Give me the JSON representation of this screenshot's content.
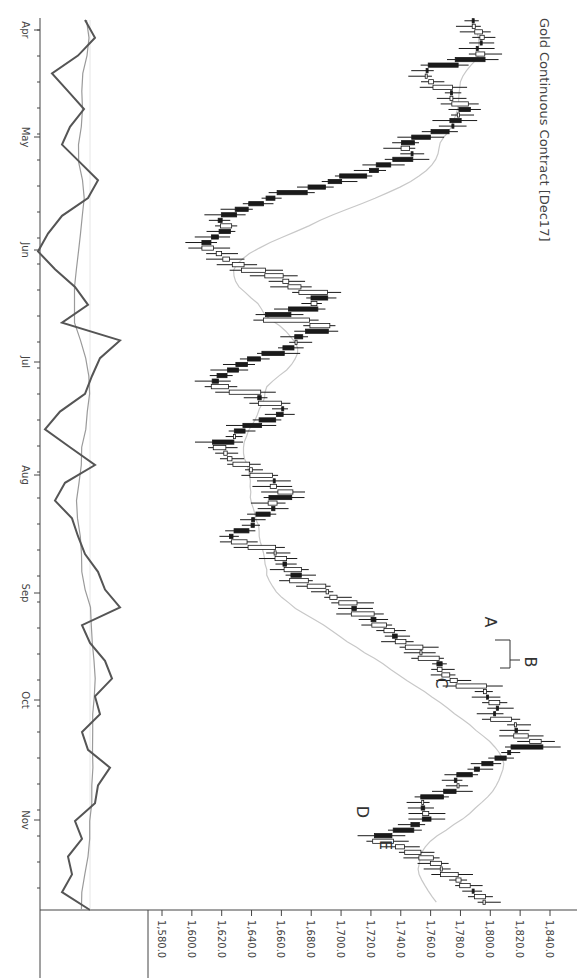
{
  "chart_data": {
    "type": "candlestick",
    "title": "Gold Continuous Contract [Dec17]",
    "orientation": "rotated-90-clockwise",
    "xlabel": "",
    "ylabel": "",
    "price_axis": {
      "ticks": [
        "1,580.0",
        "1,600.0",
        "1,620.0",
        "1,640.0",
        "1,660.0",
        "1,680.0",
        "1,700.0",
        "1,720.0",
        "1,740.0",
        "1,760.0",
        "1,780.0",
        "1,800.0",
        "1,820.0",
        "1,840.0"
      ],
      "values": [
        1580,
        1600,
        1620,
        1640,
        1660,
        1680,
        1700,
        1720,
        1740,
        1760,
        1780,
        1800,
        1820,
        1840
      ],
      "range": [
        1570,
        1850
      ]
    },
    "date_axis": {
      "ticks": [
        "Apr",
        "May",
        "Jun",
        "Jul",
        "Aug",
        "Sep",
        "Oct",
        "Nov"
      ]
    },
    "annotations": [
      {
        "label": "A",
        "approx_price": 1794,
        "approx_date": "mid-Sep"
      },
      {
        "label": "B",
        "approx_price": 1830,
        "approx_date": "late-Sep"
      },
      {
        "label": "C",
        "approx_price": 1763,
        "approx_date": "late-Sep"
      },
      {
        "label": "D",
        "approx_price": 1716,
        "approx_date": "early-Nov"
      },
      {
        "label": "E",
        "approx_price": 1741,
        "approx_date": "mid-Nov"
      }
    ],
    "series": [
      {
        "name": "Price (OHLC candles)",
        "type": "candlestick",
        "close_trajectory": [
          [
            0,
            1788
          ],
          [
            6,
            1795
          ],
          [
            10,
            1790
          ],
          [
            14,
            1802
          ],
          [
            16,
            1780
          ],
          [
            20,
            1755
          ],
          [
            24,
            1760
          ],
          [
            28,
            1773
          ],
          [
            32,
            1782
          ],
          [
            36,
            1778
          ],
          [
            40,
            1783
          ],
          [
            44,
            1770
          ],
          [
            48,
            1755
          ],
          [
            52,
            1742
          ],
          [
            56,
            1748
          ],
          [
            60,
            1735
          ],
          [
            64,
            1712
          ],
          [
            68,
            1690
          ],
          [
            72,
            1668
          ],
          [
            74,
            1650
          ],
          [
            76,
            1640
          ],
          [
            80,
            1628
          ],
          [
            84,
            1612
          ],
          [
            86,
            1635
          ],
          [
            90,
            1618
          ],
          [
            94,
            1605
          ],
          [
            98,
            1620
          ],
          [
            102,
            1628
          ],
          [
            106,
            1655
          ],
          [
            110,
            1665
          ],
          [
            114,
            1690
          ],
          [
            118,
            1682
          ],
          [
            122,
            1668
          ],
          [
            124,
            1652
          ],
          [
            128,
            1690
          ],
          [
            132,
            1672
          ],
          [
            136,
            1670
          ],
          [
            140,
            1655
          ],
          [
            142,
            1640
          ],
          [
            146,
            1622
          ],
          [
            150,
            1612
          ],
          [
            154,
            1625
          ],
          [
            156,
            1638
          ],
          [
            160,
            1650
          ],
          [
            164,
            1660
          ],
          [
            168,
            1645
          ],
          [
            172,
            1632
          ],
          [
            176,
            1622
          ],
          [
            180,
            1618
          ],
          [
            184,
            1628
          ],
          [
            188,
            1640
          ],
          [
            190,
            1650
          ],
          [
            194,
            1655
          ],
          [
            198,
            1665
          ],
          [
            200,
            1660
          ],
          [
            206,
            1652
          ],
          [
            210,
            1648
          ],
          [
            214,
            1636
          ],
          [
            218,
            1630
          ],
          [
            222,
            1650
          ],
          [
            226,
            1660
          ],
          [
            230,
            1668
          ],
          [
            234,
            1672
          ],
          [
            238,
            1685
          ],
          [
            240,
            1690
          ],
          [
            244,
            1700
          ],
          [
            248,
            1710
          ],
          [
            252,
            1722
          ],
          [
            254,
            1730
          ],
          [
            256,
            1735
          ],
          [
            260,
            1742
          ],
          [
            264,
            1752
          ],
          [
            268,
            1762
          ],
          [
            272,
            1768
          ],
          [
            276,
            1776
          ],
          [
            280,
            1790
          ],
          [
            284,
            1796
          ],
          [
            288,
            1800
          ],
          [
            292,
            1803
          ],
          [
            296,
            1810
          ],
          [
            300,
            1820
          ],
          [
            304,
            1830
          ],
          [
            306,
            1822
          ],
          [
            310,
            1808
          ],
          [
            314,
            1798
          ],
          [
            318,
            1784
          ],
          [
            322,
            1775
          ],
          [
            324,
            1772
          ],
          [
            328,
            1755
          ],
          [
            332,
            1750
          ],
          [
            336,
            1762
          ],
          [
            340,
            1735
          ],
          [
            344,
            1718
          ],
          [
            346,
            1740
          ],
          [
            350,
            1752
          ],
          [
            354,
            1760
          ],
          [
            358,
            1772
          ],
          [
            362,
            1782
          ],
          [
            366,
            1790
          ],
          [
            370,
            1795
          ],
          [
            372,
            1790
          ]
        ]
      },
      {
        "name": "Moving average (price)",
        "type": "line"
      },
      {
        "name": "Oscillator (fast)",
        "type": "line",
        "panel": "indicator"
      },
      {
        "name": "Oscillator (slow)",
        "type": "line",
        "panel": "indicator"
      }
    ],
    "grid": false,
    "legend": "none"
  },
  "labels": {
    "title": "Gold Continuous Contract [Dec17]",
    "annotation_a": "A",
    "annotation_b": "B",
    "annotation_c": "C",
    "annotation_d": "D",
    "annotation_e": "E"
  },
  "colors": {
    "candle_up_fill": "#ffffff",
    "candle_down_fill": "#1a1a1a",
    "candle_stroke": "#1a1a1a",
    "moving_average": "#c8c8c8",
    "osc_fast": "#555555",
    "osc_slow": "#9a9a9a",
    "axis": "#444444",
    "text": "#444444"
  }
}
